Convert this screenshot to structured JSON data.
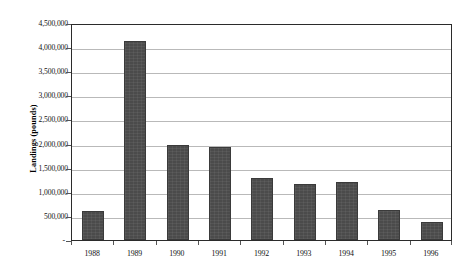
{
  "chart_data": {
    "type": "bar",
    "title": "",
    "subtitle": "",
    "xlabel": "",
    "ylabel": "Landings  (pounds)",
    "categories": [
      "1988",
      "1989",
      "1990",
      "1991",
      "1992",
      "1993",
      "1994",
      "1995",
      "1996"
    ],
    "values": [
      610000,
      4130000,
      1975000,
      1925000,
      1290000,
      1160000,
      1200000,
      630000,
      370000
    ],
    "ylim": [
      0,
      4500000
    ],
    "y_ticks": [
      0,
      500000,
      1000000,
      1500000,
      2000000,
      2500000,
      3000000,
      3500000,
      4000000,
      4500000
    ],
    "y_tick_labels": [
      "-",
      "500,000",
      "1,000,000",
      "1,500,000",
      "2,000,000",
      "2,500,000",
      "3,000,000",
      "3,500,000",
      "4,000,000",
      "4,500,000"
    ],
    "grid": true,
    "grid_axis": "y",
    "legend": false,
    "legend_position": "none",
    "series": [
      {
        "name": "Landings",
        "color": "#4b4b4b",
        "values": [
          610000,
          4130000,
          1975000,
          1925000,
          1290000,
          1160000,
          1200000,
          630000,
          370000
        ]
      }
    ],
    "annotations": []
  },
  "style": {
    "bar_color": "#4b4b4b",
    "bar_border_color": "#3a3a3a",
    "gridline_color": "#b9b9b9",
    "axis_color": "#2b2b2b",
    "background_color": "#ffffff",
    "text_color": "#111111"
  }
}
